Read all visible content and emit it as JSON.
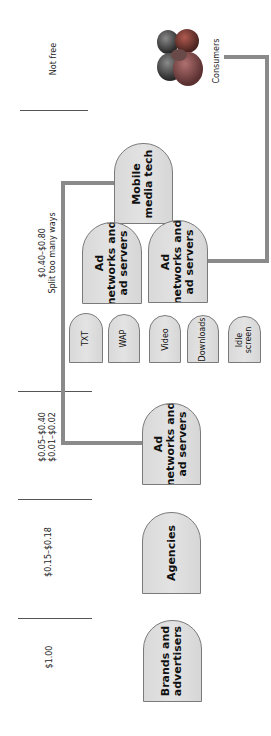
{
  "diagram": {
    "orientation": "rotated -90deg (reads bottom-to-top)",
    "price_column": [
      {
        "id": "not-free",
        "lines": [
          "Not free"
        ]
      },
      {
        "id": "mobile-tier",
        "lines": [
          "$0.40–$0.80",
          "Split too many ways"
        ]
      },
      {
        "id": "network-tier",
        "lines": [
          "$0.05–$0.40",
          "$0.01–$0.02"
        ]
      },
      {
        "id": "agency-tier",
        "lines": [
          "$0.15–$0.18"
        ]
      },
      {
        "id": "brand-tier",
        "lines": [
          "$1.00"
        ]
      }
    ],
    "nodes": {
      "brands": {
        "lines": [
          "Brands and",
          "advertisers"
        ]
      },
      "agencies": {
        "lines": [
          "Agencies"
        ]
      },
      "ad_networks_1": {
        "lines": [
          "Ad",
          "networks and",
          "ad servers"
        ]
      },
      "ad_networks_2": {
        "lines": [
          "Ad",
          "networks and",
          "ad servers"
        ]
      },
      "ad_networks_3": {
        "lines": [
          "Ad",
          "networks and",
          "ad servers"
        ]
      },
      "mobile_media_tech": {
        "lines": [
          "Mobile",
          "media tech"
        ]
      },
      "consumers": {
        "label": "Consumers",
        "icon": "people-group-icon"
      }
    },
    "channels": [
      {
        "lines": [
          "TXT"
        ]
      },
      {
        "lines": [
          "WAP"
        ]
      },
      {
        "lines": [
          "Video"
        ]
      },
      {
        "lines": [
          "Downloads"
        ]
      },
      {
        "lines": [
          "Idle",
          "screen"
        ]
      }
    ],
    "colors": {
      "node_fill": "#dedede",
      "node_border": "#7a7a7a",
      "connector": "#8a8a8a",
      "divider": "#555555"
    }
  }
}
